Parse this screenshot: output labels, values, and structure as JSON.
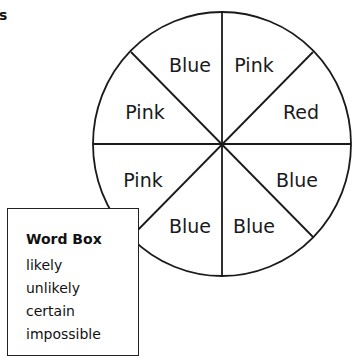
{
  "heading_fragment": "s",
  "spinner": {
    "center": [
      222,
      144
    ],
    "radius_x": 129,
    "radius_y": 132,
    "stroke_color": "#1a1a1a",
    "segments": [
      {
        "label": "Blue",
        "position": "top-left-upper",
        "x": 190,
        "y": 66
      },
      {
        "label": "Pink",
        "position": "top-right-upper",
        "x": 254,
        "y": 66
      },
      {
        "label": "Red",
        "position": "right-upper",
        "x": 301,
        "y": 113
      },
      {
        "label": "Blue",
        "position": "right-lower",
        "x": 297,
        "y": 181
      },
      {
        "label": "Blue",
        "position": "bottom-right",
        "x": 254,
        "y": 227
      },
      {
        "label": "Blue",
        "position": "bottom-left",
        "x": 190,
        "y": 227
      },
      {
        "label": "Pink",
        "position": "left-lower",
        "x": 143,
        "y": 181
      },
      {
        "label": "Pink",
        "position": "left-upper",
        "x": 145,
        "y": 113
      }
    ]
  },
  "word_box": {
    "title": "Word Box",
    "words": [
      "likely",
      "unlikely",
      "certain",
      "impossible"
    ]
  }
}
